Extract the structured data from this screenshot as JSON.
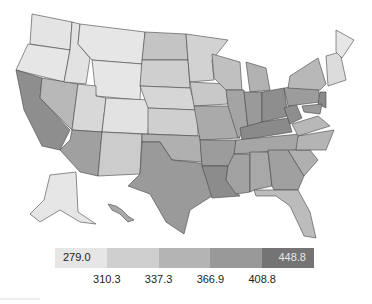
{
  "map": {
    "type": "choropleth",
    "region": "United States (contiguous + Alaska + Hawaii insets)",
    "shading": "grayscale, darker = higher value",
    "high_regions": [
      "California Central Valley",
      "Southern Arizona",
      "Texas",
      "Ohio Valley",
      "Kentucky",
      "Tennessee",
      "Arkansas",
      "Louisiana",
      "Mississippi"
    ],
    "low_regions": [
      "Montana",
      "Wyoming",
      "Idaho",
      "Oregon",
      "Alaska",
      "Maine",
      "Colorado",
      "Utah"
    ]
  },
  "legend": {
    "bins": [
      {
        "label": "279.0",
        "color": "#e6e6e6",
        "text_color": "#222222"
      },
      {
        "label": "",
        "color": "#cfcfcf",
        "text_color": "#222222"
      },
      {
        "label": "",
        "color": "#b4b4b4",
        "text_color": "#222222"
      },
      {
        "label": "",
        "color": "#999999",
        "text_color": "#222222"
      },
      {
        "label": "448.8",
        "color": "#747474",
        "text_color": "#e8e8e8"
      }
    ],
    "breaks": [
      "310.3",
      "337.3",
      "366.9",
      "408.8"
    ]
  }
}
